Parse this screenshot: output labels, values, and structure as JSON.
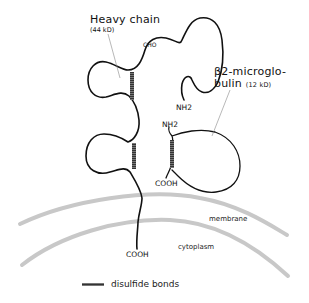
{
  "diagram": {
    "type": "protein-structure",
    "colors": {
      "chain": "#111111",
      "disulfide": "#555555",
      "membrane": "#c8c8c8",
      "pointer": "#888888",
      "text": "#111111"
    },
    "heavy_chain": {
      "label": "Heavy chain",
      "weight": "(44 kD)",
      "carbohydrate_label": "CHO",
      "n_terminus": "NH2",
      "c_terminus": "COOH"
    },
    "beta2_microglobulin": {
      "label_line1": "β2-microglo-",
      "label_line2": "bulin",
      "weight": "(12 kD)",
      "n_terminus": "NH2",
      "c_terminus": "COOH"
    },
    "regions": {
      "membrane": "membrane",
      "cytoplasm": "cytoplasm"
    },
    "legend": {
      "disulfide_label": "disulfide bonds"
    }
  }
}
